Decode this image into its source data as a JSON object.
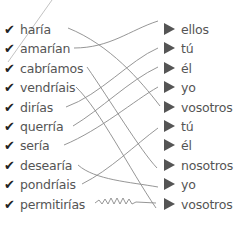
{
  "exercise": {
    "left_items": [
      {
        "label": "haría",
        "checked": true
      },
      {
        "label": "amarían",
        "checked": true
      },
      {
        "label": "cabríamos",
        "checked": true
      },
      {
        "label": "vendríais",
        "checked": true
      },
      {
        "label": "dirías",
        "checked": true
      },
      {
        "label": "querría",
        "checked": true
      },
      {
        "label": "sería",
        "checked": true
      },
      {
        "label": "desearía",
        "checked": true
      },
      {
        "label": "pondríais",
        "checked": true
      },
      {
        "label": "permitirías",
        "checked": true
      }
    ],
    "right_items": [
      {
        "label": "ellos"
      },
      {
        "label": "tú"
      },
      {
        "label": "él"
      },
      {
        "label": "yo"
      },
      {
        "label": "vosotros"
      },
      {
        "label": "tú"
      },
      {
        "label": "él"
      },
      {
        "label": "nosotros"
      },
      {
        "label": "yo"
      },
      {
        "label": "vosotros"
      }
    ],
    "check_glyph": "✔",
    "colors": {
      "text": "#555555",
      "check": "#222222",
      "line": "#888888",
      "triangle": "#555555"
    }
  }
}
